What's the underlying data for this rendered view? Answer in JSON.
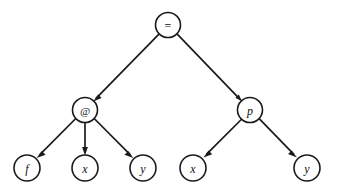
{
  "diagram": {
    "background_color": "#ffffff",
    "line_color": "#1a1a1a",
    "node_fill": "#ffffff",
    "node_radius": 12.5,
    "leaf_radius": 13,
    "nodes": [
      {
        "id": "root",
        "label": "=",
        "kind": "operator",
        "cx": 168,
        "cy": 25,
        "r": 12.5
      },
      {
        "id": "apply",
        "label": "@",
        "kind": "apply",
        "cx": 85,
        "cy": 110,
        "r": 12.5
      },
      {
        "id": "pred",
        "label": "p",
        "kind": "identifier",
        "cx": 250,
        "cy": 110,
        "r": 12.5
      },
      {
        "id": "leaf-f",
        "label": "f",
        "kind": "identifier",
        "cx": 27,
        "cy": 168,
        "r": 13
      },
      {
        "id": "leaf-x1",
        "label": "x",
        "kind": "identifier",
        "cx": 85,
        "cy": 168,
        "r": 13
      },
      {
        "id": "leaf-y1",
        "label": "y",
        "kind": "identifier",
        "cx": 143,
        "cy": 168,
        "r": 13
      },
      {
        "id": "leaf-x2",
        "label": "x",
        "kind": "identifier",
        "cx": 193,
        "cy": 168,
        "r": 13
      },
      {
        "id": "leaf-y2",
        "label": "y",
        "kind": "identifier",
        "cx": 307,
        "cy": 168,
        "r": 13
      }
    ],
    "edges": [
      {
        "id": "edge-root-apply",
        "from": "root",
        "to": "apply",
        "arrow": true
      },
      {
        "id": "edge-root-pred",
        "from": "root",
        "to": "pred",
        "arrow": true
      },
      {
        "id": "edge-apply-f",
        "from": "apply",
        "to": "leaf-f",
        "arrow": true
      },
      {
        "id": "edge-apply-x",
        "from": "apply",
        "to": "leaf-x1",
        "arrow": true
      },
      {
        "id": "edge-apply-y",
        "from": "apply",
        "to": "leaf-y1",
        "arrow": true
      },
      {
        "id": "edge-pred-x",
        "from": "pred",
        "to": "leaf-x2",
        "arrow": true
      },
      {
        "id": "edge-pred-y",
        "from": "pred",
        "to": "leaf-y2",
        "arrow": true
      }
    ]
  }
}
